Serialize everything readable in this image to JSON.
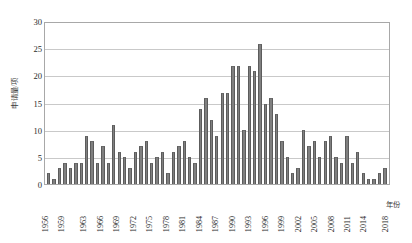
{
  "chart_data": {
    "type": "bar",
    "title": "",
    "xlabel": "年份",
    "ylabel": "申请量/项",
    "ylim": [
      0,
      30
    ],
    "yticks": [
      0,
      5,
      10,
      15,
      20,
      25,
      30
    ],
    "grid": true,
    "legend": false,
    "bar_color": "#808080",
    "categories": [
      "1956",
      "1957",
      "1958",
      "1959",
      "1960",
      "1961",
      "1962",
      "1963",
      "1964",
      "1965",
      "1966",
      "1967",
      "1968",
      "1969",
      "1970",
      "1971",
      "1972",
      "1973",
      "1974",
      "1975",
      "1976",
      "1977",
      "1978",
      "1979",
      "1980",
      "1981",
      "1982",
      "1983",
      "1984",
      "1985",
      "1986",
      "1987",
      "1988",
      "1989",
      "1990",
      "1991",
      "1992",
      "1993",
      "1994",
      "1995",
      "1996",
      "1997",
      "1998",
      "1999",
      "2000",
      "2001",
      "2002",
      "2003",
      "2004",
      "2005",
      "2006",
      "2007",
      "2008",
      "2009",
      "2010",
      "2011",
      "2012",
      "2013",
      "2014",
      "2015",
      "2016",
      "2017",
      "2018"
    ],
    "values": [
      2,
      1,
      3,
      4,
      3,
      4,
      4,
      9,
      8,
      4,
      7,
      4,
      11,
      6,
      5,
      3,
      6,
      7,
      8,
      4,
      5,
      6,
      2,
      6,
      7,
      8,
      5,
      4,
      14,
      16,
      12,
      9,
      17,
      17,
      22,
      22,
      10,
      22,
      21,
      26,
      15,
      16,
      13,
      8,
      5,
      2,
      3,
      10,
      7,
      8,
      5,
      8,
      9,
      5,
      4,
      9,
      4,
      6,
      2,
      1,
      1,
      2,
      3
    ],
    "xtick_labels": [
      "1956",
      "1959",
      "1963",
      "1966",
      "1969",
      "1972",
      "1975",
      "1978",
      "1981",
      "1984",
      "1987",
      "1990",
      "1993",
      "1996",
      "1999",
      "2002",
      "2005",
      "2008",
      "2011",
      "2014",
      "2018"
    ],
    "xtick_indices": [
      0,
      3,
      7,
      10,
      13,
      16,
      19,
      22,
      25,
      28,
      31,
      34,
      37,
      40,
      43,
      46,
      49,
      52,
      55,
      58,
      62
    ]
  }
}
